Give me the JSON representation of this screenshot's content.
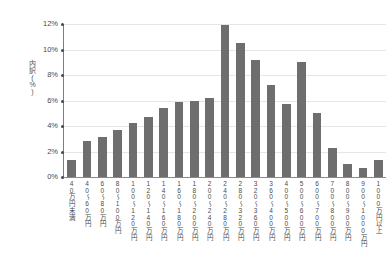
{
  "chart_data": {
    "type": "bar",
    "title": "",
    "xlabel": "",
    "ylabel": "内訳(%)",
    "ylim": [
      0,
      12
    ],
    "grid": true,
    "legend": "none",
    "bar_color": "#6e6e6e",
    "ytick_labels": [
      "12%",
      "10%",
      "8%",
      "6%",
      "4%",
      "2%",
      "0%"
    ],
    "ytick_values": [
      12,
      10,
      8,
      6,
      4,
      2,
      0
    ],
    "categories": [
      "40万円未満",
      "40〜60万円",
      "60〜80万円",
      "80〜100万円",
      "100〜120万円",
      "120〜140万円",
      "140〜160万円",
      "160〜180万円",
      "180〜200万円",
      "200〜240万円",
      "240〜280万円",
      "280〜320万円",
      "320〜360万円",
      "360〜400万円",
      "400〜500万円",
      "500〜600万円",
      "600〜700万円",
      "700〜800万円",
      "800〜900万円",
      "900〜1000万円",
      "1000万円以上"
    ],
    "values": [
      1.3,
      2.8,
      3.1,
      3.7,
      4.2,
      4.7,
      5.4,
      5.9,
      6.0,
      6.2,
      11.9,
      10.5,
      9.2,
      7.2,
      5.7,
      9.0,
      5.0,
      2.3,
      1.0,
      0.7,
      1.3
    ]
  }
}
